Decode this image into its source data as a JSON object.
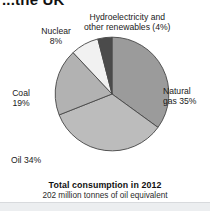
{
  "chart_title": "...the UK",
  "chart_data": {
    "type": "pie",
    "title": "...the UK",
    "categories": [
      "Natural gas",
      "Oil",
      "Coal",
      "Nuclear",
      "Hydroelectricity and other renewables"
    ],
    "values": [
      35,
      34,
      19,
      8,
      4
    ],
    "unit": "percent",
    "colors": [
      "#9b9b9b",
      "#bcbcbc",
      "#b2b2b2",
      "#f1f1f1",
      "#4b4b4b"
    ],
    "slice_border_color": "#4a4a4a",
    "start_angle_deg": 0,
    "direction": "clockwise",
    "legend": "none",
    "grid": false,
    "labels": [
      {
        "key": "gas",
        "text": "Natural\ngas 35%",
        "percent": 35
      },
      {
        "key": "oil",
        "text": "Oil 34%",
        "percent": 34
      },
      {
        "key": "coal",
        "text": "Coal\n19%",
        "percent": 19
      },
      {
        "key": "nuclear",
        "text": "Nuclear\n8%",
        "percent": 8
      },
      {
        "key": "hydro",
        "text": "Hydroelectricity and\nother renewables (4%)",
        "percent": 4
      }
    ],
    "caption_main": "Total consumption in 2012",
    "caption_sub": "202 million tonnes of oil equivalent"
  },
  "labels": {
    "hydro_line1": "Hydroelectricity and",
    "hydro_line2": "other renewables (4%)",
    "nuclear_line1": "Nuclear",
    "nuclear_line2": "8%",
    "coal_line1": "Coal",
    "coal_line2": "19%",
    "oil": "Oil 34%",
    "gas_line1": "Natural",
    "gas_line2": "gas 35%"
  },
  "caption": {
    "main": "Total consumption in 2012",
    "sub": "202 million tonnes of oil equivalent"
  }
}
